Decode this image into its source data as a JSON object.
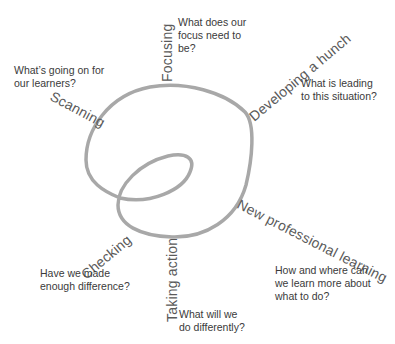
{
  "diagram": {
    "curve_color": "#a6a6a6",
    "stages": [
      {
        "id": "scanning",
        "label": "Scanning",
        "question_lines": [
          "What’s going on for",
          "our learners?"
        ]
      },
      {
        "id": "focusing",
        "label": "Focusing",
        "question_lines": [
          "What does our",
          "focus need to",
          "be?"
        ]
      },
      {
        "id": "developing-a-hunch",
        "label": "Developing a hunch",
        "question_lines": [
          "What is leading",
          "to this situation?"
        ]
      },
      {
        "id": "new-professional-learning",
        "label": "New professional learning",
        "question_lines": [
          "How and where can",
          "we learn more about",
          "what to do?"
        ]
      },
      {
        "id": "taking-action",
        "label": "Taking action",
        "question_lines": [
          "What will we",
          "do differently?"
        ]
      },
      {
        "id": "checking",
        "label": "Checking",
        "question_lines": [
          "Have we made",
          "enough difference?"
        ]
      }
    ]
  }
}
